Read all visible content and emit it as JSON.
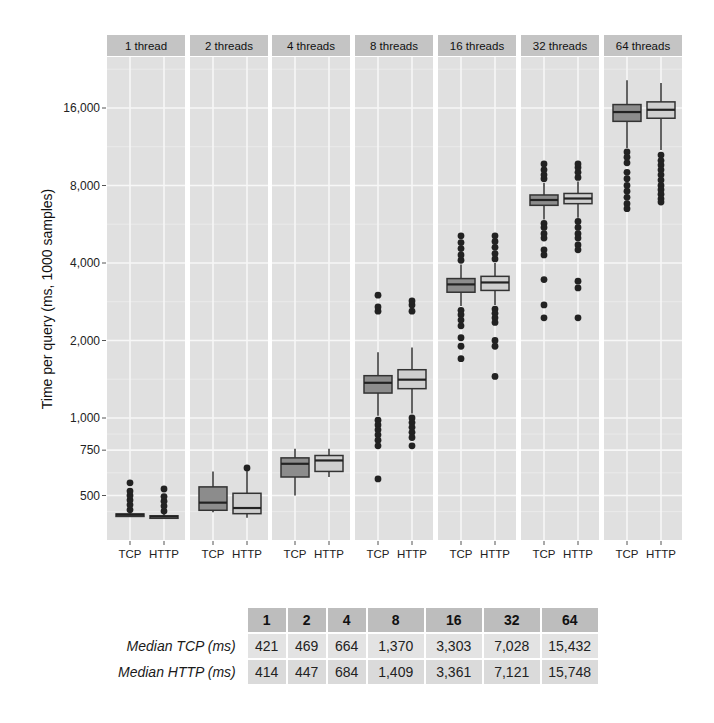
{
  "chart_data": {
    "type": "box",
    "title": "",
    "ylabel": "Time per query (ms, 1000 samples)",
    "xlabel": "",
    "yscale": "log2",
    "yticks": [
      500,
      750,
      1000,
      2000,
      4000,
      8000,
      16000
    ],
    "ytick_labels": [
      "500",
      "750",
      "1,000",
      "2,000",
      "4,000",
      "8,000",
      "16,000"
    ],
    "facets": [
      "1 thread",
      "2 threads",
      "4 threads",
      "8 threads",
      "16 threads",
      "32 threads",
      "64 threads"
    ],
    "categories": [
      "TCP",
      "HTTP"
    ],
    "colors": {
      "TCP": "#8c8c8c",
      "HTTP": "#cfcfcf",
      "panel_bg": "#e0e0e0",
      "strip_bg": "#c4c4c4",
      "grid": "#f7f7f7"
    },
    "series": [
      {
        "facet": "1 thread",
        "TCP": {
          "q1": 418,
          "median": 421,
          "q3": 424,
          "whisker_low": 416,
          "whisker_high": 430,
          "outliers": [
            440,
            460,
            480,
            500,
            520,
            560
          ]
        },
        "HTTP": {
          "q1": 411,
          "median": 414,
          "q3": 417,
          "whisker_low": 409,
          "whisker_high": 424,
          "outliers": [
            435,
            455,
            475,
            495,
            530
          ]
        }
      },
      {
        "facet": "2 threads",
        "TCP": {
          "q1": 438,
          "median": 469,
          "q3": 540,
          "whisker_low": 430,
          "whisker_high": 620,
          "outliers": []
        },
        "HTTP": {
          "q1": 425,
          "median": 447,
          "q3": 510,
          "whisker_low": 410,
          "whisker_high": 630,
          "outliers": [
            640
          ]
        }
      },
      {
        "facet": "4 threads",
        "TCP": {
          "q1": 590,
          "median": 664,
          "q3": 700,
          "whisker_low": 500,
          "whisker_high": 760,
          "outliers": []
        },
        "HTTP": {
          "q1": 620,
          "median": 684,
          "q3": 715,
          "whisker_low": 590,
          "whisker_high": 760,
          "outliers": []
        }
      },
      {
        "facet": "8 threads",
        "TCP": {
          "q1": 1250,
          "median": 1370,
          "q3": 1460,
          "whisker_low": 1020,
          "whisker_high": 1800,
          "outliers": [
            980,
            940,
            900,
            860,
            820,
            780,
            580,
            2600,
            2700,
            3000
          ]
        },
        "HTTP": {
          "q1": 1300,
          "median": 1409,
          "q3": 1540,
          "whisker_low": 1040,
          "whisker_high": 1880,
          "outliers": [
            1000,
            960,
            920,
            880,
            840,
            780,
            2600,
            2750,
            2850
          ]
        }
      },
      {
        "facet": "16 threads",
        "TCP": {
          "q1": 3080,
          "median": 3303,
          "q3": 3480,
          "whisker_low": 2720,
          "whisker_high": 3950,
          "outliers": [
            2620,
            2520,
            2400,
            2280,
            2050,
            1900,
            1700,
            4100,
            4300,
            4550,
            4800,
            5100
          ]
        },
        "HTTP": {
          "q1": 3130,
          "median": 3361,
          "q3": 3550,
          "whisker_low": 2750,
          "whisker_high": 4000,
          "outliers": [
            2650,
            2550,
            2450,
            2350,
            2000,
            1900,
            1450,
            4150,
            4350,
            4600,
            4850,
            5100
          ]
        }
      },
      {
        "facet": "32 threads",
        "TCP": {
          "q1": 6700,
          "median": 7028,
          "q3": 7350,
          "whisker_low": 5900,
          "whisker_high": 8200,
          "outliers": [
            5700,
            5500,
            5200,
            5000,
            4500,
            4300,
            3450,
            2750,
            2450,
            8500,
            8800,
            9200,
            9700
          ]
        },
        "HTTP": {
          "q1": 6800,
          "median": 7121,
          "q3": 7450,
          "whisker_low": 6000,
          "whisker_high": 8300,
          "outliers": [
            5800,
            5500,
            5200,
            5000,
            4700,
            4500,
            3400,
            3200,
            2450,
            8600,
            9000,
            9400,
            9700
          ]
        }
      },
      {
        "facet": "64 threads",
        "TCP": {
          "q1": 14200,
          "median": 15432,
          "q3": 16500,
          "whisker_low": 11200,
          "whisker_high": 20500,
          "outliers": [
            10800,
            10300,
            9800,
            9000,
            8500,
            8000,
            7600,
            7200,
            6800,
            6500
          ]
        },
        "HTTP": {
          "q1": 14600,
          "median": 15748,
          "q3": 16900,
          "whisker_low": 11000,
          "whisker_high": 20000,
          "outliers": [
            10500,
            10000,
            9600,
            9200,
            8800,
            8400,
            8000,
            7700,
            7400,
            7100,
            6900
          ]
        }
      }
    ]
  },
  "table": {
    "columns": [
      "1",
      "2",
      "4",
      "8",
      "16",
      "32",
      "64"
    ],
    "rows": [
      {
        "label": "Median TCP (ms)",
        "values": [
          "421",
          "469",
          "664",
          "1,370",
          "3,303",
          "7,028",
          "15,432"
        ]
      },
      {
        "label": "Median HTTP (ms)",
        "values": [
          "414",
          "447",
          "684",
          "1,409",
          "3,361",
          "7,121",
          "15,748"
        ]
      }
    ]
  }
}
